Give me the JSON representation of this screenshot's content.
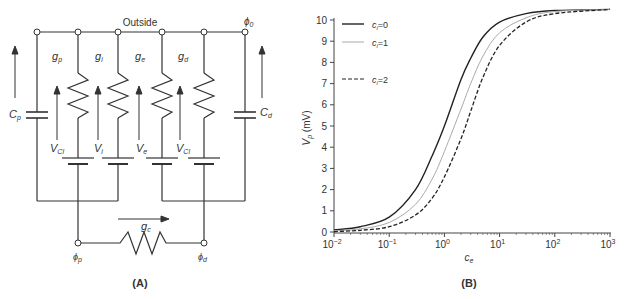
{
  "panel_a": {
    "label": "(A)",
    "outside_label": "Outside",
    "phi0": "ϕ",
    "phi0_sub": "0",
    "phip": "ϕ",
    "phip_sub": "p",
    "phid": "ϕ",
    "phid_sub": "d",
    "conductances": [
      {
        "g": "g",
        "sub": "p"
      },
      {
        "g": "g",
        "sub": "i"
      },
      {
        "g": "g",
        "sub": "e"
      },
      {
        "g": "g",
        "sub": "d"
      }
    ],
    "voltages": [
      {
        "v": "V",
        "sub": "Cl"
      },
      {
        "v": "V",
        "sub": "i"
      },
      {
        "v": "V",
        "sub": "e"
      },
      {
        "v": "V",
        "sub": "Cl"
      }
    ],
    "cp": "C",
    "cp_sub": "p",
    "cd": "C",
    "cd_sub": "d",
    "gc": "g",
    "gc_sub": "c"
  },
  "panel_b": {
    "label": "(B)"
  },
  "chart_data": {
    "type": "line",
    "title": "",
    "xlabel": "c_e",
    "ylabel": "V_p (mV)",
    "xscale": "log",
    "xlim": [
      0.01,
      1000
    ],
    "ylim": [
      0,
      10
    ],
    "xticks": [
      "10^-2",
      "10^-1",
      "10^0",
      "10^1",
      "10^2",
      "10^3"
    ],
    "yticks": [
      "0",
      "1",
      "2",
      "3",
      "4",
      "5",
      "6",
      "7",
      "8",
      "9",
      "10"
    ],
    "legend_position": "upper left",
    "grid": false,
    "x": [
      0.01,
      0.03,
      0.1,
      0.3,
      0.6,
      1,
      2,
      3,
      5,
      10,
      30,
      100,
      1000
    ],
    "series": [
      {
        "name": "c_i=0",
        "style": "solid-dark",
        "values": [
          0.1,
          0.25,
          0.7,
          2.0,
          3.6,
          5.0,
          7.2,
          8.2,
          9.2,
          9.9,
          10.3,
          10.45,
          10.5
        ]
      },
      {
        "name": "c_i=1",
        "style": "solid-light",
        "values": [
          0.05,
          0.15,
          0.45,
          1.3,
          2.5,
          3.8,
          5.8,
          7.0,
          8.3,
          9.4,
          10.1,
          10.4,
          10.5
        ]
      },
      {
        "name": "c_i=2",
        "style": "dashed",
        "values": [
          0.02,
          0.08,
          0.25,
          0.8,
          1.6,
          2.6,
          4.4,
          5.7,
          7.3,
          8.8,
          9.9,
          10.3,
          10.5
        ]
      }
    ],
    "legend": [
      {
        "label": "c",
        "sub": "i",
        "eq": "=0"
      },
      {
        "label": "c",
        "sub": "i",
        "eq": "=1"
      },
      {
        "label": "c",
        "sub": "i",
        "eq": "=2"
      }
    ],
    "ylabel_main": "V",
    "ylabel_sub": "p",
    "ylabel_unit": " (mV)",
    "xlabel_main": "c",
    "xlabel_sub": "e"
  }
}
